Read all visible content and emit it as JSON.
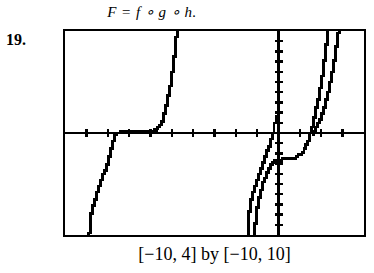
{
  "exercise": {
    "number": "19.",
    "formula": "F = f ∘ g ∘ h.",
    "window_caption": "[−10, 4] by [−10, 10]"
  },
  "chart_data": {
    "type": "line",
    "title": "",
    "subtitle": "",
    "xlabel": "",
    "ylabel": "",
    "xlim": [
      -10,
      4
    ],
    "ylim": [
      -10,
      10
    ],
    "xticks": [
      -9,
      -8,
      -7,
      -6,
      -5,
      -4,
      -3,
      -2,
      -1,
      1,
      2,
      3
    ],
    "yticks": [
      -9,
      -8,
      -7,
      -6,
      -5,
      -4,
      -3,
      -2,
      -1,
      1,
      2,
      3,
      4,
      5,
      6,
      7,
      8,
      9
    ],
    "grid": false,
    "legend": null,
    "axes_style": "calculator-tick-axes",
    "stroke_color": "#000000",
    "background_color": "#ffffff",
    "series": [
      {
        "name": "curve-left-cube-root",
        "note": "steeply rising S-curve crossing x-axis near x = -7.7",
        "points": [
          [
            -8.85,
            -10.0
          ],
          [
            -8.82,
            -8.6
          ],
          [
            -8.7,
            -7.4
          ],
          [
            -8.55,
            -6.3
          ],
          [
            -8.4,
            -5.3
          ],
          [
            -8.25,
            -4.4
          ],
          [
            -8.1,
            -3.6
          ],
          [
            -7.98,
            -2.8
          ],
          [
            -7.88,
            -2.0
          ],
          [
            -7.8,
            -1.2
          ],
          [
            -7.72,
            -0.5
          ],
          [
            -7.62,
            0.0
          ],
          [
            -7.35,
            0.12
          ],
          [
            -6.9,
            0.18
          ],
          [
            -6.3,
            0.22
          ],
          [
            -5.7,
            0.25
          ]
        ]
      },
      {
        "name": "curve-left-exponential",
        "note": "steep rise from x-axis near x = -5.6 up to top of window",
        "points": [
          [
            -6.3,
            0.1
          ],
          [
            -6.0,
            0.18
          ],
          [
            -5.75,
            0.35
          ],
          [
            -5.55,
            0.75
          ],
          [
            -5.4,
            1.4
          ],
          [
            -5.28,
            2.3
          ],
          [
            -5.18,
            3.3
          ],
          [
            -5.08,
            4.4
          ],
          [
            -5.0,
            5.5
          ],
          [
            -4.92,
            6.6
          ],
          [
            -4.86,
            7.7
          ],
          [
            -4.8,
            8.8
          ],
          [
            -4.76,
            9.9
          ],
          [
            -4.74,
            10.0
          ]
        ]
      },
      {
        "name": "curve-center-left",
        "note": "S-curve rising from bottom, crossing x-axis just left of y-axis",
        "points": [
          [
            -1.42,
            -10.0
          ],
          [
            -1.42,
            -8.8
          ],
          [
            -1.38,
            -7.8
          ],
          [
            -1.3,
            -6.9
          ],
          [
            -1.2,
            -6.0
          ],
          [
            -1.08,
            -5.1
          ],
          [
            -0.95,
            -4.3
          ],
          [
            -0.82,
            -3.5
          ],
          [
            -0.68,
            -2.7
          ],
          [
            -0.55,
            -1.9
          ],
          [
            -0.42,
            -1.1
          ],
          [
            -0.3,
            -0.4
          ],
          [
            -0.22,
            0.2
          ],
          [
            -0.16,
            0.9
          ],
          [
            -0.1,
            1.7
          ]
        ]
      },
      {
        "name": "curve-center-right",
        "note": "second nearly-parallel S-curve, slightly right of the previous one",
        "points": [
          [
            -1.1,
            -10.0
          ],
          [
            -1.08,
            -8.6
          ],
          [
            -1.02,
            -7.5
          ],
          [
            -0.93,
            -6.5
          ],
          [
            -0.82,
            -5.6
          ],
          [
            -0.7,
            -4.8
          ],
          [
            -0.58,
            -4.1
          ],
          [
            -0.45,
            -3.5
          ],
          [
            -0.3,
            -3.0
          ],
          [
            -0.12,
            -2.7
          ],
          [
            0.08,
            -2.6
          ],
          [
            0.3,
            -2.55
          ]
        ]
      },
      {
        "name": "curve-right-exponential",
        "note": "flat near y = -2.6 then sharply rising past the right edge",
        "points": [
          [
            0.1,
            -2.6
          ],
          [
            0.45,
            -2.58
          ],
          [
            0.8,
            -2.4
          ],
          [
            1.05,
            -2.0
          ],
          [
            1.25,
            -1.4
          ],
          [
            1.42,
            -0.6
          ],
          [
            1.55,
            0.3
          ],
          [
            1.68,
            1.4
          ],
          [
            1.8,
            2.6
          ],
          [
            1.92,
            3.9
          ],
          [
            2.02,
            5.2
          ],
          [
            2.12,
            6.6
          ],
          [
            2.2,
            8.0
          ],
          [
            2.28,
            9.4
          ],
          [
            2.32,
            10.0
          ]
        ]
      },
      {
        "name": "curve-far-right-exponential",
        "note": "steepest branch hugging the right part of the window",
        "points": [
          [
            1.55,
            -0.2
          ],
          [
            1.8,
            0.6
          ],
          [
            2.0,
            1.6
          ],
          [
            2.18,
            2.8
          ],
          [
            2.34,
            4.1
          ],
          [
            2.48,
            5.5
          ],
          [
            2.6,
            6.9
          ],
          [
            2.7,
            8.3
          ],
          [
            2.78,
            9.6
          ],
          [
            2.82,
            10.0
          ]
        ]
      }
    ]
  }
}
